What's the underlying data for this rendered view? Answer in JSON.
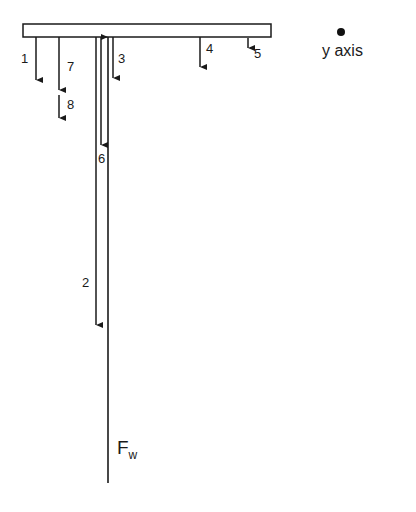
{
  "diagram": {
    "type": "free-body force diagram",
    "colors": {
      "stroke": "#1a1a1a",
      "fill": "#ffffff",
      "dot": "#111111"
    },
    "beam": {
      "x": 23,
      "y": 24,
      "width": 248,
      "height": 13
    },
    "axis_marker": {
      "label": "y axis",
      "dot": {
        "cx": 341,
        "cy": 32,
        "r": 4
      }
    },
    "force_label": {
      "main": "F",
      "subscript": "w"
    },
    "arrows": [
      {
        "id": "1",
        "label": "1",
        "x": 36,
        "y1": 37,
        "y2": 80,
        "direction": "down"
      },
      {
        "id": "2",
        "label": "2",
        "x": 96,
        "y1": 37,
        "y2": 325,
        "direction": "down"
      },
      {
        "id": "3",
        "label": "3",
        "x": 113,
        "y1": 37,
        "y2": 78,
        "direction": "down"
      },
      {
        "id": "4",
        "label": "4",
        "x": 200,
        "y1": 37,
        "y2": 67,
        "direction": "down"
      },
      {
        "id": "5",
        "label": "5",
        "x": 248,
        "y1": 38,
        "y2": 48,
        "direction": "down"
      },
      {
        "id": "6",
        "label": "6",
        "x": 101,
        "y1": 37,
        "y2": 145,
        "direction": "down"
      },
      {
        "id": "7",
        "label": "7",
        "x": 59,
        "y1": 37,
        "y2": 90,
        "direction": "down"
      },
      {
        "id": "8",
        "label": "8",
        "x": 59,
        "y1": 95,
        "y2": 118,
        "direction": "down"
      },
      {
        "id": "Fw",
        "label": "Fw",
        "x": 108,
        "y1": 37,
        "y2": 483,
        "direction": "up"
      }
    ]
  }
}
